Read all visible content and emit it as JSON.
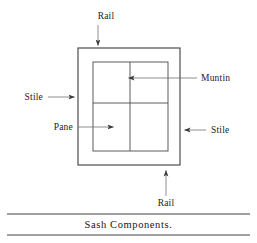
{
  "figure": {
    "caption": "Sash Components.",
    "labels": {
      "rail_top": "Rail",
      "rail_bottom": "Rail",
      "stile_left": "Stile",
      "stile_right": "Stile",
      "muntin": "Muntin",
      "pane": "Pane"
    },
    "colors": {
      "line": "#4a4a4a",
      "frame": "#3d3d3d",
      "text": "#1c1c1c",
      "rule": "#2b2b2b",
      "background": "#ffffff"
    }
  },
  "diagram": {
    "outer_frame": {
      "x": 78,
      "y": 48,
      "width": 102,
      "height": 117
    },
    "glass_area": {
      "x": 93,
      "y": 62,
      "width": 75,
      "height": 89
    },
    "muntin_vertical_x": 130,
    "muntin_horizontal_y": 103,
    "leaders": [
      {
        "name": "rail-top",
        "label": "Rail",
        "text_x": 106,
        "text_y": 19,
        "line": [
          98,
          24,
          98,
          46
        ],
        "arrow": "down"
      },
      {
        "name": "rail-bottom",
        "label": "Rail",
        "text_x": 158,
        "text_y": 202,
        "line": [
          166,
          197,
          166,
          170
        ],
        "arrow": "up"
      },
      {
        "name": "stile-left",
        "label": "Stile",
        "text_x": 21,
        "text_y": 101,
        "line": [
          49,
          97,
          75,
          97
        ],
        "arrow": "right"
      },
      {
        "name": "stile-right",
        "label": "Stile",
        "text_x": 210,
        "text_y": 134,
        "line": [
          205,
          130,
          183,
          130
        ],
        "arrow": "left"
      },
      {
        "name": "muntin",
        "label": "Muntin",
        "text_x": 200,
        "text_y": 82,
        "line": [
          196,
          78,
          128,
          78
        ],
        "arrow": "left"
      },
      {
        "name": "pane",
        "label": "Pane",
        "text_x": 52,
        "text_y": 131,
        "line": [
          79,
          127,
          114,
          127
        ],
        "arrow": "right"
      }
    ]
  },
  "caption_rules": {
    "top_rule_y": 214,
    "bottom_rule_y": 235,
    "rule_left": 7,
    "rule_right": 250
  }
}
